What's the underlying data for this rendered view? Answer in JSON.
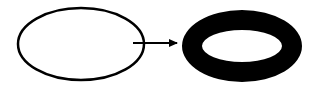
{
  "diagram": {
    "background": "#ffffff",
    "stroke_color": "#000000",
    "source_shape": {
      "label": "thin ellipse",
      "cx": 81,
      "cy": 44,
      "rx": 63,
      "ry": 36,
      "stroke_width": 2.5,
      "fill": "none"
    },
    "arrow": {
      "label": "transforms into",
      "x1": 133,
      "y1": 43,
      "x2": 177,
      "y2": 43,
      "stroke_width": 2
    },
    "target_shape": {
      "label": "thick ring",
      "outer": {
        "cx": 242,
        "cy": 46,
        "rx": 60,
        "ry": 36
      },
      "inner": {
        "cx": 242,
        "cy": 46,
        "rx": 40,
        "ry": 16
      },
      "fill": "#000000"
    }
  }
}
